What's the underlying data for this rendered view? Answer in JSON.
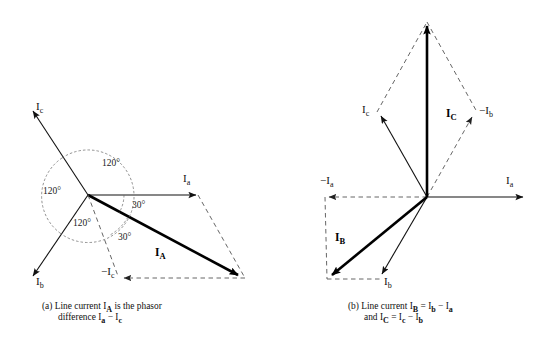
{
  "figure": {
    "background": "#ffffff",
    "ink": "#111111"
  },
  "panel_a": {
    "id": "(a)",
    "caption_line1": "Line current I",
    "caption_sub1": "A",
    "caption_line1b": " is the phasor",
    "caption_line2": "difference I",
    "caption_sub2": "a",
    "caption_line2b": " − I",
    "caption_sub3": "c",
    "vectors": [
      {
        "name": "Ia",
        "label": "I",
        "sub": "a",
        "style": "solid",
        "angle_deg": 0,
        "desc": "phase current a, horizontal right"
      },
      {
        "name": "Ic",
        "label": "I",
        "sub": "c",
        "style": "solid",
        "angle_deg": 120,
        "desc": "phase current c, upper left"
      },
      {
        "name": "Ib",
        "label": "I",
        "sub": "b",
        "style": "solid",
        "angle_deg": 240,
        "desc": "phase current b, lower left"
      },
      {
        "name": "minus-Ic",
        "label": "−I",
        "sub": "c",
        "style": "dashed",
        "angle_deg": 300,
        "desc": "negative of Ic, lower right direction drawn to left of resultant tip"
      },
      {
        "name": "IA",
        "label": "I",
        "sub": "A",
        "style": "bold",
        "angle_deg": -30,
        "desc": "line current A, resultant"
      }
    ],
    "angles": [
      {
        "name": "angle-top",
        "value": "120°"
      },
      {
        "name": "angle-left",
        "value": "120°"
      },
      {
        "name": "angle-bottom",
        "value": "120°"
      },
      {
        "name": "angle-Ia-to-IA",
        "value": "30°"
      },
      {
        "name": "angle-IA-to-minusIc",
        "value": "30°"
      }
    ]
  },
  "panel_b": {
    "id": "(b)",
    "caption_line1": "Line current I",
    "caption_sub1": "B",
    "caption_line1b": " = I",
    "caption_sub2": "b",
    "caption_line1c": " − I",
    "caption_sub3": "a",
    "caption_line2": "and I",
    "caption_sub4": "C",
    "caption_line2b": " = I",
    "caption_sub5": "c",
    "caption_line2c": " − I",
    "caption_sub6": "b",
    "vectors": [
      {
        "name": "Ia",
        "label": "I",
        "sub": "a",
        "style": "solid",
        "angle_deg": 0,
        "desc": "phase current a, horizontal right"
      },
      {
        "name": "Ic",
        "label": "I",
        "sub": "c",
        "style": "solid",
        "angle_deg": 120,
        "desc": "phase current c, upper left"
      },
      {
        "name": "Ib",
        "label": "I",
        "sub": "b",
        "style": "solid",
        "angle_deg": 240,
        "desc": "phase current b, lower right-down"
      },
      {
        "name": "minus-Ia",
        "label": "−I",
        "sub": "a",
        "style": "dashed",
        "angle_deg": 180,
        "desc": "negative of Ia, horizontal left"
      },
      {
        "name": "minus-Ib",
        "label": "−I",
        "sub": "b",
        "style": "dashed",
        "angle_deg": 60,
        "desc": "negative of Ib, upper right"
      },
      {
        "name": "IB",
        "label": "I",
        "sub": "B",
        "style": "bold",
        "angle_deg": 210,
        "desc": "line current B resultant, lower left"
      },
      {
        "name": "IC",
        "label": "I",
        "sub": "C",
        "style": "bold",
        "angle_deg": 90,
        "desc": "line current C resultant, vertical up"
      }
    ]
  }
}
